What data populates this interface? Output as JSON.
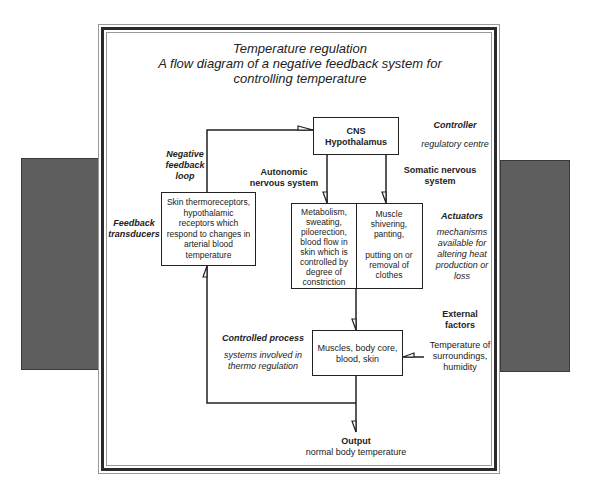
{
  "title": {
    "line1": "Temperature regulation",
    "line2": "A flow diagram of a negative feedback system for",
    "line3": "controlling temperature"
  },
  "nodes": {
    "controller_box": {
      "line1": "CNS",
      "line2": "Hypothalamus"
    },
    "transducer_box": {
      "line1": "Skin thermoreceptors,",
      "line2": "hypothalamic",
      "line3": "receptors which",
      "line4": "respond to changes in",
      "line5": "arterial blood",
      "line6": "temperature"
    },
    "actuator_autonomic_box": {
      "line1": "Metabolism,",
      "line2": "sweating,",
      "line3": "piloerection,",
      "line4": "blood flow in",
      "line5": "skin which is",
      "line6": "controlled by",
      "line7": "degree of",
      "line8": "constriction"
    },
    "actuator_somatic_box": {
      "line1": "Muscle",
      "line2": "shivering,",
      "line3": "panting,",
      "line4": "putting on or",
      "line5": "removal of",
      "line6": "clothes"
    },
    "process_box": {
      "line1": "Muscles, body core,",
      "line2": "blood, skin"
    }
  },
  "labels": {
    "controller": {
      "heading": "Controller",
      "desc": "regulatory centre"
    },
    "actuators": {
      "heading": "Actuators",
      "desc1": "mechanisms",
      "desc2": "available for",
      "desc3": "altering heat",
      "desc4": "production or",
      "desc5": "loss"
    },
    "negative_feedback_loop": {
      "line1": "Negative",
      "line2": "feedback",
      "line3": "loop"
    },
    "feedback_transducers": {
      "line1": "Feedback",
      "line2": "transducers"
    },
    "autonomic": {
      "line1": "Autonomic",
      "line2": "nervous system"
    },
    "somatic": {
      "line1": "Somatic nervous",
      "line2": "system"
    },
    "controlled_process": {
      "heading": "Controlled process",
      "desc1": "systems involved in",
      "desc2": "thermo regulation"
    },
    "external_factors": {
      "heading1": "External",
      "heading2": "factors",
      "desc1": "Temperature of",
      "desc2": "surroundings,",
      "desc3": "humidity"
    },
    "output": {
      "heading": "Output",
      "desc": "normal body temperature"
    }
  },
  "colors": {
    "line": "#222222",
    "side_panel": "#5e5e5e",
    "frame_dark": "#2b2b2b",
    "frame_light": "#9a9a9a"
  }
}
